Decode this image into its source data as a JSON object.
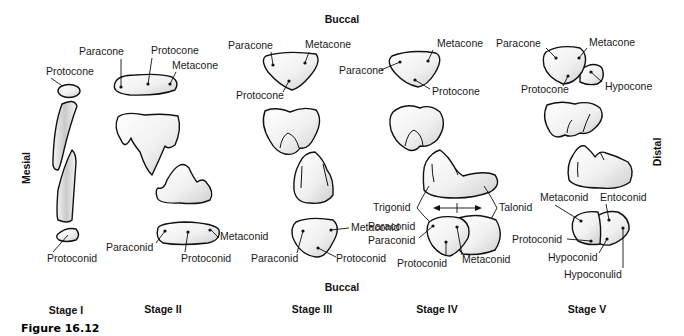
{
  "orientation": {
    "top": "Buccal",
    "bottom": "Buccal",
    "left": "Mesial",
    "right": "Distal"
  },
  "stages": [
    {
      "label": "Stage I",
      "upper_labels": [
        "Protocone"
      ],
      "lower_labels": [
        "Protoconid"
      ]
    },
    {
      "label": "Stage II",
      "upper_labels": [
        "Paracone",
        "Protocone",
        "Metacone"
      ],
      "lower_labels": [
        "Metaconid",
        "Paraconid",
        "Protoconid"
      ]
    },
    {
      "label": "Stage III",
      "upper_labels": [
        "Paracone",
        "Metacone",
        "Protocone"
      ],
      "lower_labels": [
        "Metaconid",
        "Paraconid",
        "Protoconid"
      ]
    },
    {
      "label": "Stage IV",
      "upper_labels": [
        "Paracone",
        "Metacone",
        "Protocone"
      ],
      "lower_labels": [
        "Trigonid",
        "Talonid",
        "Paraconid",
        "Protoconid",
        "Metaconid"
      ]
    },
    {
      "label": "Stage V",
      "upper_labels": [
        "Paracone",
        "Metacone",
        "Protocone",
        "Hypocone"
      ],
      "lower_labels": [
        "Metaconid",
        "Entoconid",
        "Protoconid",
        "Hypoconid",
        "Hypoconulid"
      ]
    }
  ],
  "figure_caption": "Figure 16.12"
}
